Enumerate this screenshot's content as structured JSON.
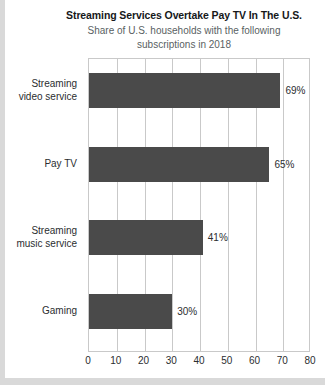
{
  "chart_data": {
    "type": "bar",
    "orientation": "horizontal",
    "title": "Streaming Services Overtake Pay TV In The U.S.",
    "subtitle_line1": "Share of U.S. households with the following",
    "subtitle_line2": "subscriptions in 2018",
    "categories": [
      "Streaming video service",
      "Pay TV",
      "Streaming music service",
      "Gaming"
    ],
    "category_lines": [
      [
        "Streaming",
        "video service"
      ],
      [
        "Pay TV"
      ],
      [
        "Streaming",
        "music service"
      ],
      [
        "Gaming"
      ]
    ],
    "values": [
      69,
      65,
      41,
      30
    ],
    "value_labels": [
      "69%",
      "65%",
      "41%",
      "30%"
    ],
    "xlabel": "",
    "ylabel": "",
    "xlim": [
      0,
      80
    ],
    "xticks": [
      0,
      10,
      20,
      30,
      40,
      50,
      60,
      70,
      80
    ],
    "xtick_labels": [
      "0",
      "10",
      "20",
      "30",
      "40",
      "50",
      "60",
      "70",
      "80"
    ],
    "grid": "vertical",
    "legend": "none",
    "bar_color": "#4a4a4a",
    "grid_color": "#c9c9c9",
    "background_color": "#ffffff"
  }
}
